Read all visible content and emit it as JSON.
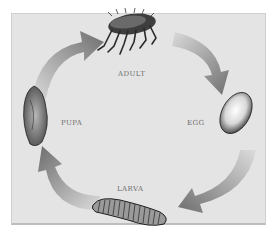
{
  "diagram": {
    "type": "life-cycle",
    "background_color": "#e4e4e4",
    "arrow_color": "#7a7a7a",
    "stages": [
      {
        "id": "adult",
        "label": "ADULT",
        "position": "top"
      },
      {
        "id": "egg",
        "label": "EGG",
        "position": "right"
      },
      {
        "id": "larva",
        "label": "LARVA",
        "position": "bottom"
      },
      {
        "id": "pupa",
        "label": "PUPA",
        "position": "left"
      }
    ],
    "flow": [
      {
        "from": "ADULT",
        "to": "EGG"
      },
      {
        "from": "EGG",
        "to": "LARVA"
      },
      {
        "from": "LARVA",
        "to": "PUPA"
      },
      {
        "from": "PUPA",
        "to": "ADULT"
      }
    ]
  }
}
